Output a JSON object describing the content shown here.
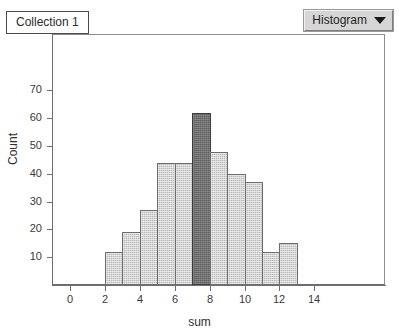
{
  "window": {
    "collection_label": "Collection 1"
  },
  "toolbar": {
    "plot_type_label": "Histogram",
    "caret_icon": "chevron-down-icon"
  },
  "chart_data": {
    "type": "bar",
    "title": "",
    "subtitle": "",
    "xlabel": "sum",
    "ylabel": "Count",
    "xlim": [
      -1,
      15
    ],
    "ylim": [
      0,
      75
    ],
    "grid": false,
    "legend": false,
    "bin_width": 1,
    "bin_starts": [
      2,
      3,
      4,
      5,
      6,
      7,
      8,
      9,
      10,
      11,
      12
    ],
    "categories": [
      "2-3",
      "3-4",
      "4-5",
      "5-6",
      "6-7",
      "7-8",
      "8-9",
      "9-10",
      "10-11",
      "11-12",
      "12-13"
    ],
    "values": [
      12,
      19,
      27,
      44,
      44,
      62,
      48,
      40,
      37,
      12,
      15
    ],
    "selected_index": 5,
    "xticks": [
      0,
      2,
      4,
      6,
      8,
      10,
      12,
      14
    ],
    "xticklabels": [
      "0",
      "2",
      "4",
      "6",
      "8",
      "10",
      "12",
      "14"
    ],
    "yticks": [
      10,
      20,
      30,
      40,
      50,
      60,
      70
    ],
    "yticklabels": [
      "10",
      "20",
      "30",
      "40",
      "50",
      "60",
      "70"
    ],
    "bar_color": "#b9b9b9",
    "bar_edge_color": "#6d6d6d",
    "selected_bar_color": "#5d5d5d",
    "axis_color": "#6f6f6f"
  }
}
